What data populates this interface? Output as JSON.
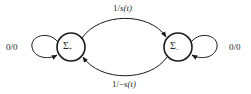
{
  "diagram": {
    "type": "state-transition",
    "nodes": [
      {
        "id": "sigma-plus",
        "symbol": "Σ",
        "subscript": "+",
        "cx": 71,
        "cy": 47,
        "r": 14
      },
      {
        "id": "sigma-minus",
        "symbol": "Σ",
        "subscript": "−",
        "cx": 178,
        "cy": 47,
        "r": 14
      }
    ],
    "edges": [
      {
        "from": "sigma-plus",
        "to": "sigma-minus",
        "label_prefix": "1/",
        "label_var": "s(t)",
        "position": "top"
      },
      {
        "from": "sigma-minus",
        "to": "sigma-plus",
        "label_prefix": "1/−",
        "label_var": "s(t)",
        "position": "bottom"
      },
      {
        "from": "sigma-plus",
        "to": "sigma-plus",
        "label": "0/0",
        "position": "left-loop"
      },
      {
        "from": "sigma-minus",
        "to": "sigma-minus",
        "label": "0/0",
        "position": "right-loop"
      }
    ],
    "colors": {
      "stroke": "#1a1a1a",
      "text": "#2a2a2a",
      "background": "#ffffff"
    }
  }
}
